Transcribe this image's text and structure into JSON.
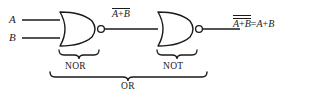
{
  "diagram": {
    "stroke_color": "#1a1a1a",
    "background_color": "#ffffff",
    "inputs": [
      {
        "label": "A",
        "y": 20
      },
      {
        "label": "B",
        "y": 38
      }
    ],
    "gates": [
      {
        "name": "nor-gate",
        "type": "NOR",
        "brace_label": "NOR",
        "inverted": true
      },
      {
        "name": "not-gate",
        "type": "NOT",
        "brace_label": "NOT",
        "inverted": true
      }
    ],
    "braces": [
      {
        "name": "nor-brace",
        "label": "NOR"
      },
      {
        "name": "not-brace",
        "label": "NOT"
      },
      {
        "name": "or-brace",
        "label": "OR"
      }
    ],
    "expressions": {
      "intermediate": {
        "operand_a": "A",
        "operator": "+",
        "operand_b": "B",
        "bars": 1
      },
      "output_left": {
        "operand_a": "A",
        "operator": "+",
        "operand_b": "B",
        "bars": 2
      },
      "equals": "=",
      "output_right": {
        "operand_a": "A",
        "operator": "+",
        "operand_b": "B",
        "bars": 0
      }
    }
  }
}
